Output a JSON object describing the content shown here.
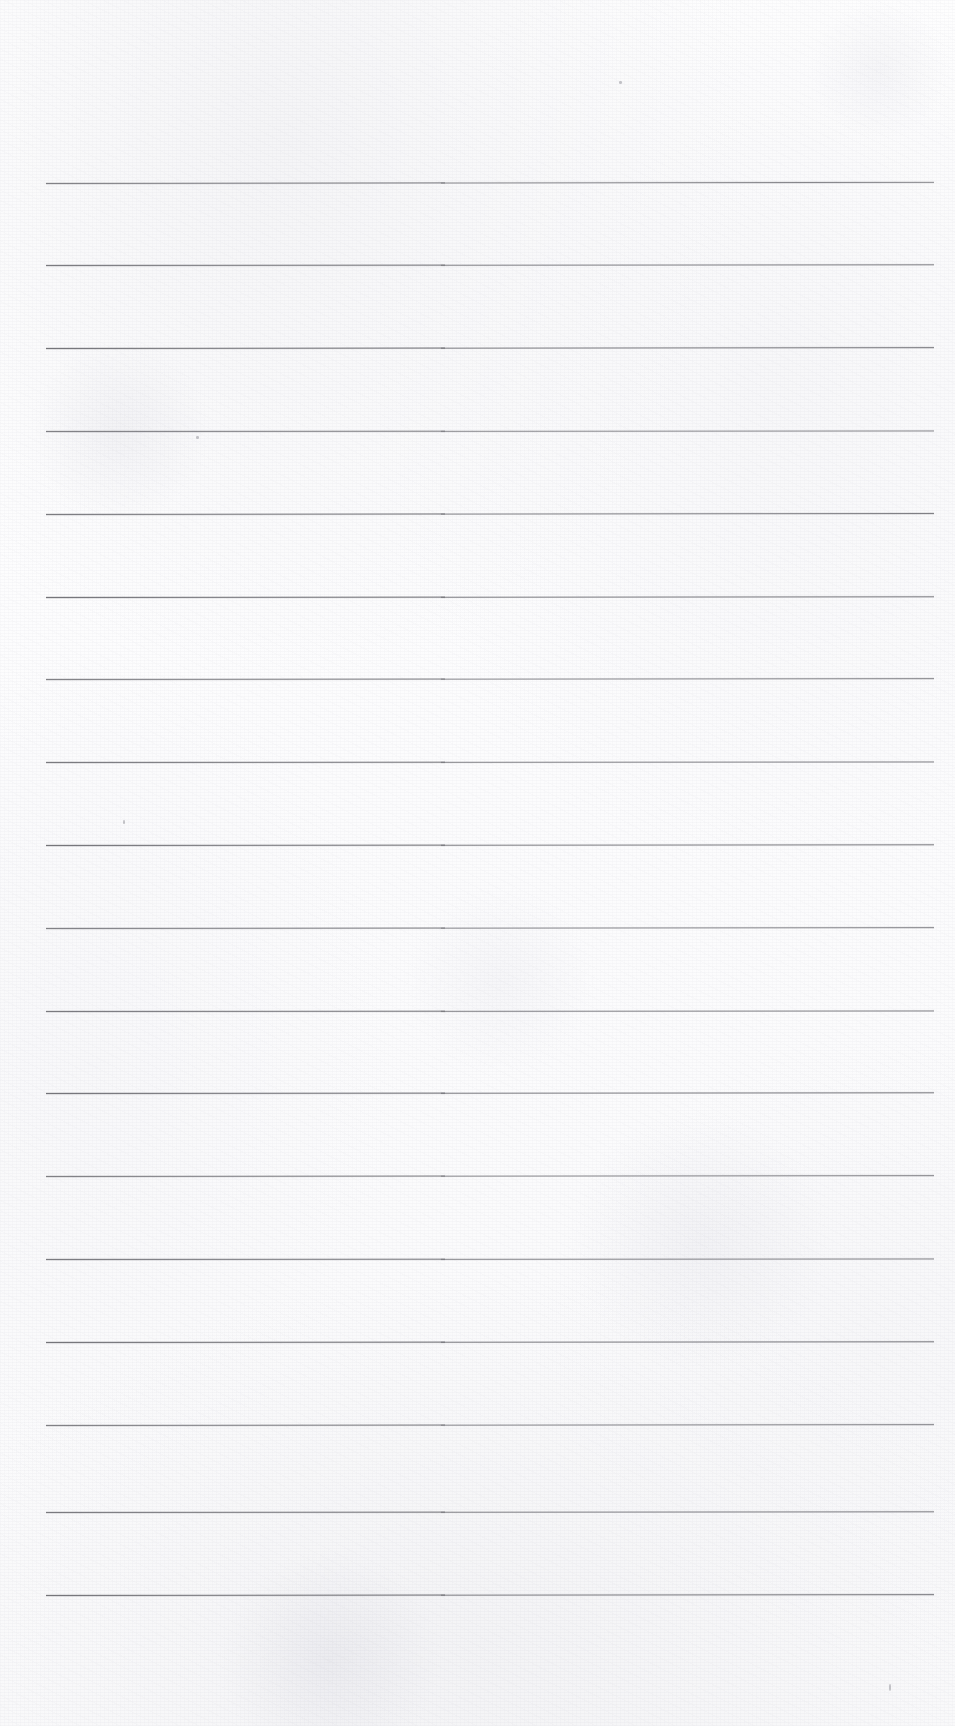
{
  "document": {
    "type": "scanned-blank-ruled-page",
    "title": "",
    "body_text": "",
    "handwriting": "",
    "page_number": "",
    "header_text": "",
    "footer_text": ""
  },
  "page": {
    "width": 955,
    "height": 1726,
    "background_color": "#fdfdfd",
    "paper_tone_color": "#fafafb"
  },
  "ruling": {
    "line_color": "#5e5e64",
    "line_count": 18,
    "line_thickness": 3,
    "line_start_x": 46,
    "line_end_x": 932,
    "line_spacing": 82.8,
    "first_line_y": 183,
    "lines_y": [
      183,
      265.8,
      348.6,
      431.4,
      514.2,
      597,
      679.8,
      762.6,
      845.4,
      928.2,
      1011,
      1093.8,
      1176.6,
      1259.4,
      1342.2,
      1425,
      1512,
      1595
    ],
    "line_slopes_deg": [
      -0.08,
      -0.05,
      -0.06,
      -0.04,
      -0.07,
      -0.05,
      -0.06,
      -0.04,
      -0.05,
      -0.06,
      -0.04,
      -0.05,
      -0.06,
      -0.04,
      -0.05,
      -0.06,
      -0.05,
      -0.06
    ]
  },
  "artifacts": {
    "specks": [
      {
        "x": 889,
        "y": 1684,
        "w": 2,
        "h": 7
      },
      {
        "x": 619,
        "y": 81,
        "w": 3,
        "h": 3
      },
      {
        "x": 196,
        "y": 436,
        "w": 3,
        "h": 3
      },
      {
        "x": 123,
        "y": 820,
        "w": 2,
        "h": 4
      }
    ]
  }
}
